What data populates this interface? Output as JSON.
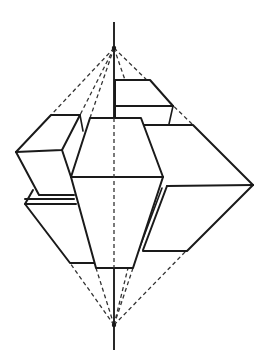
{
  "figure": {
    "colors": {
      "line": "#1a1a1a",
      "background": "#ffffff"
    },
    "axis": {
      "x": 114,
      "top": 22,
      "bottom": 350
    },
    "apex_top": [
      114,
      48
    ],
    "apex_bottom": [
      114,
      325
    ]
  }
}
